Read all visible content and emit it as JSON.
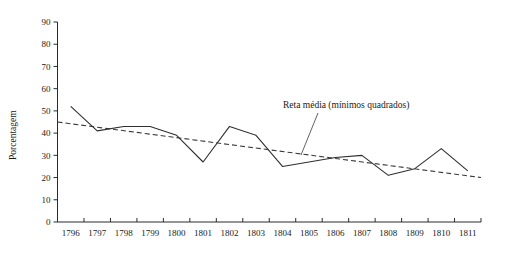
{
  "chart_data": {
    "type": "line",
    "title": "",
    "xlabel": "",
    "ylabel": "Porcentagem",
    "ylim": [
      0,
      90
    ],
    "ytick_step": 10,
    "grid": false,
    "legend_position": "annotation-inline",
    "categories": [
      "1796",
      "1797",
      "1798",
      "1799",
      "1800",
      "1801",
      "1802",
      "1803",
      "1804",
      "1805",
      "1806",
      "1807",
      "1808",
      "1809",
      "1810",
      "1811"
    ],
    "yticks": [
      "0",
      "10",
      "20",
      "30",
      "40",
      "50",
      "60",
      "70",
      "80",
      "90"
    ],
    "series": [
      {
        "name": "Porcentagem observada",
        "style": "solid",
        "values": [
          52,
          41,
          43,
          43,
          39,
          27,
          43,
          39,
          25,
          27,
          29,
          30,
          21,
          24,
          33,
          23
        ]
      },
      {
        "name": "Reta média (mínimos quadrados)",
        "style": "dashed",
        "values": [
          45,
          44.3,
          43.6,
          42.9,
          42.2,
          41.5,
          38.5,
          36.5,
          34.5,
          32.5,
          30.5,
          28.5,
          26.0,
          24.0,
          22.0,
          20.0
        ],
        "endpoints": {
          "start_value": 45,
          "end_value": 20
        }
      }
    ],
    "annotations": [
      {
        "text": "Reta média (mínimos quadrados)",
        "x_category": "1806",
        "points_to_series": "Reta média (mínimos quadrados)"
      }
    ],
    "colors": {
      "series_line": "#2f2f2f",
      "trend_line": "#3a3a3a",
      "axis": "#2b2b2b",
      "background": "#ffffff",
      "text": "#1a1a1a"
    }
  }
}
